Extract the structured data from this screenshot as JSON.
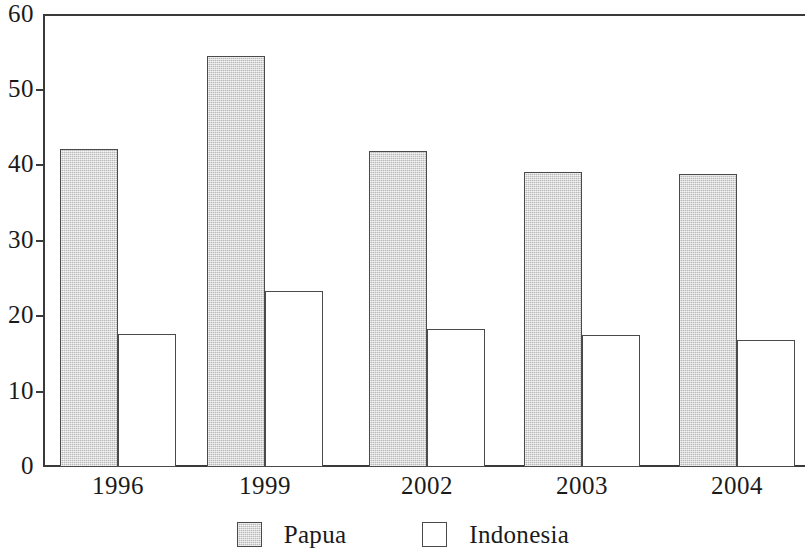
{
  "chart_data": {
    "type": "bar",
    "title": "",
    "subtitle": "",
    "xlabel": "",
    "ylabel": "",
    "categories": [
      "1996",
      "1999",
      "2002",
      "2003",
      "2004"
    ],
    "series": [
      {
        "name": "Papua",
        "values": [
          42.2,
          54.6,
          42.0,
          39.2,
          38.9
        ],
        "color": "#cfcfcf"
      },
      {
        "name": "Indonesia",
        "values": [
          17.6,
          23.4,
          18.3,
          17.5,
          16.8
        ],
        "color": "#ffffff"
      }
    ],
    "ylim": [
      0,
      60
    ],
    "yticks": [
      0,
      10,
      20,
      30,
      40,
      50,
      60
    ],
    "ytick_labels": [
      "0",
      "10",
      "20",
      "30",
      "40",
      "50",
      "60"
    ],
    "grid": false,
    "legend_position": "bottom",
    "legend_entries": [
      {
        "label": "Papua",
        "swatch": "filled-gray-square"
      },
      {
        "label": "Indonesia",
        "swatch": "empty-white-square"
      }
    ],
    "annotations": []
  }
}
